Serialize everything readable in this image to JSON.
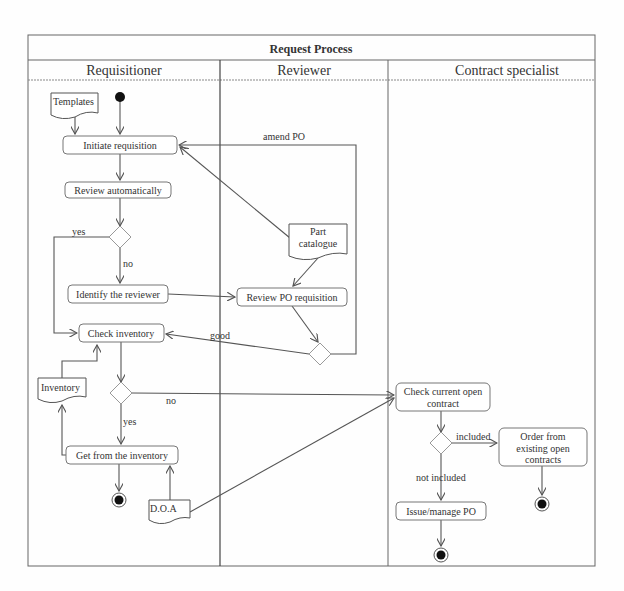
{
  "diagram": {
    "title": "Request Process",
    "lanes": [
      {
        "id": "requisitioner",
        "label": "Requisitioner",
        "x": 28,
        "w": 192
      },
      {
        "id": "reviewer",
        "label": "Reviewer",
        "x": 220,
        "w": 168
      },
      {
        "id": "contract-specialist",
        "label": "Contract specialist",
        "x": 388,
        "w": 207
      }
    ],
    "nodes": [
      {
        "id": "start",
        "type": "initial",
        "lane": "requisitioner",
        "cx": 120,
        "cy": 97
      },
      {
        "id": "templates",
        "type": "document",
        "label": "Templates",
        "lane": "requisitioner",
        "x": 51,
        "y": 93,
        "w": 47,
        "h": 25
      },
      {
        "id": "initiate",
        "type": "action",
        "label": "Initiate requisition",
        "lane": "requisitioner",
        "x": 63,
        "y": 136,
        "w": 114,
        "h": 18
      },
      {
        "id": "review-auto",
        "type": "action",
        "label": "Review automatically",
        "lane": "requisitioner",
        "x": 65,
        "y": 182,
        "w": 106,
        "h": 16
      },
      {
        "id": "decision-1",
        "type": "decision",
        "lane": "requisitioner",
        "cx": 120,
        "cy": 237
      },
      {
        "id": "identify",
        "type": "action",
        "label": "Identify the reviewer",
        "lane": "requisitioner",
        "x": 68,
        "y": 285,
        "w": 100,
        "h": 18
      },
      {
        "id": "check-inventory",
        "type": "action",
        "label": "Check inventory",
        "lane": "requisitioner",
        "x": 79,
        "y": 324,
        "w": 85,
        "h": 18
      },
      {
        "id": "inventory",
        "type": "document",
        "label": "Inventory",
        "lane": "requisitioner",
        "x": 38,
        "y": 378,
        "w": 48,
        "h": 25
      },
      {
        "id": "decision-2",
        "type": "decision",
        "lane": "requisitioner",
        "cx": 121,
        "cy": 393
      },
      {
        "id": "get-inventory",
        "type": "action",
        "label": "Get from the inventory",
        "lane": "requisitioner",
        "x": 66,
        "y": 446,
        "w": 112,
        "h": 18
      },
      {
        "id": "end-1",
        "type": "final",
        "lane": "requisitioner",
        "cx": 119,
        "cy": 500
      },
      {
        "id": "doa",
        "type": "document",
        "label": "D.O.A",
        "lane": "requisitioner",
        "x": 149,
        "y": 500,
        "w": 41,
        "h": 25
      },
      {
        "id": "part-catalogue",
        "type": "document",
        "label": "Part catalogue",
        "lane": "reviewer",
        "x": 289,
        "y": 224,
        "w": 58,
        "h": 34
      },
      {
        "id": "review-po",
        "type": "action",
        "label": "Review PO requisition",
        "lane": "reviewer",
        "x": 237,
        "y": 288,
        "w": 110,
        "h": 18
      },
      {
        "id": "decision-3",
        "type": "decision",
        "lane": "reviewer",
        "cx": 320,
        "cy": 354
      },
      {
        "id": "check-contract",
        "type": "action",
        "label": "Check current open contract",
        "lane": "contract-specialist",
        "x": 396,
        "y": 383,
        "w": 94,
        "h": 28
      },
      {
        "id": "decision-4",
        "type": "decision",
        "lane": "contract-specialist",
        "cx": 441,
        "cy": 443
      },
      {
        "id": "order-existing",
        "type": "action",
        "label": "Order from existing open contracts",
        "lane": "contract-specialist",
        "x": 499,
        "y": 428,
        "w": 88,
        "h": 38
      },
      {
        "id": "end-2",
        "type": "final",
        "lane": "contract-specialist",
        "cx": 542,
        "cy": 504
      },
      {
        "id": "issue-po",
        "type": "action",
        "label": "Issue/manage PO",
        "lane": "contract-specialist",
        "x": 396,
        "y": 502,
        "w": 90,
        "h": 18
      },
      {
        "id": "end-3",
        "type": "final",
        "lane": "contract-specialist",
        "cx": 441,
        "cy": 555
      }
    ],
    "edges": [
      {
        "from": "start",
        "to": "initiate",
        "label": ""
      },
      {
        "from": "templates",
        "to": "initiate",
        "label": ""
      },
      {
        "from": "initiate",
        "to": "review-auto",
        "label": ""
      },
      {
        "from": "review-auto",
        "to": "decision-1",
        "label": ""
      },
      {
        "from": "decision-1",
        "to": "check-inventory",
        "label": "yes"
      },
      {
        "from": "decision-1",
        "to": "identify",
        "label": "no"
      },
      {
        "from": "identify",
        "to": "review-po",
        "label": ""
      },
      {
        "from": "part-catalogue",
        "to": "initiate",
        "label": ""
      },
      {
        "from": "part-catalogue",
        "to": "review-po",
        "label": ""
      },
      {
        "from": "review-po",
        "to": "decision-3",
        "label": ""
      },
      {
        "from": "decision-3",
        "to": "initiate",
        "label": "amend PO"
      },
      {
        "from": "decision-3",
        "to": "check-inventory",
        "label": "good"
      },
      {
        "from": "check-inventory",
        "to": "decision-2",
        "label": ""
      },
      {
        "from": "inventory",
        "to": "check-inventory",
        "label": ""
      },
      {
        "from": "decision-2",
        "to": "get-inventory",
        "label": "yes"
      },
      {
        "from": "decision-2",
        "to": "check-contract",
        "label": "no"
      },
      {
        "from": "get-inventory",
        "to": "inventory",
        "label": ""
      },
      {
        "from": "get-inventory",
        "to": "end-1",
        "label": ""
      },
      {
        "from": "doa",
        "to": "get-inventory",
        "label": ""
      },
      {
        "from": "doa",
        "to": "check-contract",
        "label": ""
      },
      {
        "from": "check-contract",
        "to": "decision-4",
        "label": ""
      },
      {
        "from": "decision-4",
        "to": "order-existing",
        "label": "included"
      },
      {
        "from": "decision-4",
        "to": "issue-po",
        "label": "not included"
      },
      {
        "from": "order-existing",
        "to": "end-2",
        "label": ""
      },
      {
        "from": "issue-po",
        "to": "end-3",
        "label": ""
      }
    ]
  },
  "labels": {
    "title": "Request Process",
    "lane_requisitioner": "Requisitioner",
    "lane_reviewer": "Reviewer",
    "lane_contract": "Contract specialist",
    "templates": "Templates",
    "initiate": "Initiate requisition",
    "review_auto": "Review automatically",
    "identify": "Identify the reviewer",
    "check_inventory": "Check inventory",
    "inventory": "Inventory",
    "get_inventory": "Get from the inventory",
    "doa": "D.O.A",
    "part_catalogue_1": "Part",
    "part_catalogue_2": "catalogue",
    "review_po": "Review PO requisition",
    "check_contract_1": "Check current open",
    "check_contract_2": "contract",
    "order_1": "Order from",
    "order_2": "existing open",
    "order_3": "contracts",
    "issue_po": "Issue/manage PO",
    "edge_yes_1": "yes",
    "edge_no_1": "no",
    "edge_amend": "amend PO",
    "edge_good": "good",
    "edge_no_2": "no",
    "edge_yes_2": "yes",
    "edge_included": "included",
    "edge_not_included": "not included"
  }
}
